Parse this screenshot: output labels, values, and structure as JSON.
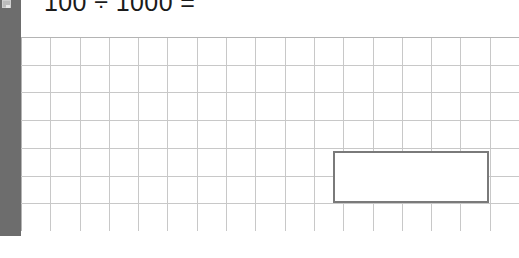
{
  "page": {
    "background_color": "#ffffff",
    "width": 519,
    "height": 258
  },
  "left_rail": {
    "name": "left-toolbar-rail",
    "color": "#6d6d6d",
    "icon": "app-tile-icon"
  },
  "prompt": {
    "text": "100 ÷ 1000 =",
    "dividend": "100",
    "operator": "÷",
    "divisor": "1000",
    "equals": "=",
    "color": "#1b1b1b"
  },
  "grid": {
    "name": "squared-paper-grid",
    "columns": 17,
    "rows": 7,
    "cell_width": 29.3,
    "cell_height": 27.7,
    "line_color": "#c8c8c8",
    "border_color": "#b4b4b4",
    "background": "#ffffff"
  },
  "answer_box": {
    "name": "answer-input-box",
    "value": "",
    "placeholder": "",
    "border_color": "#7a7a7a",
    "background": "#ffffff",
    "left": 333,
    "top": 151,
    "width": 156,
    "height": 52
  }
}
